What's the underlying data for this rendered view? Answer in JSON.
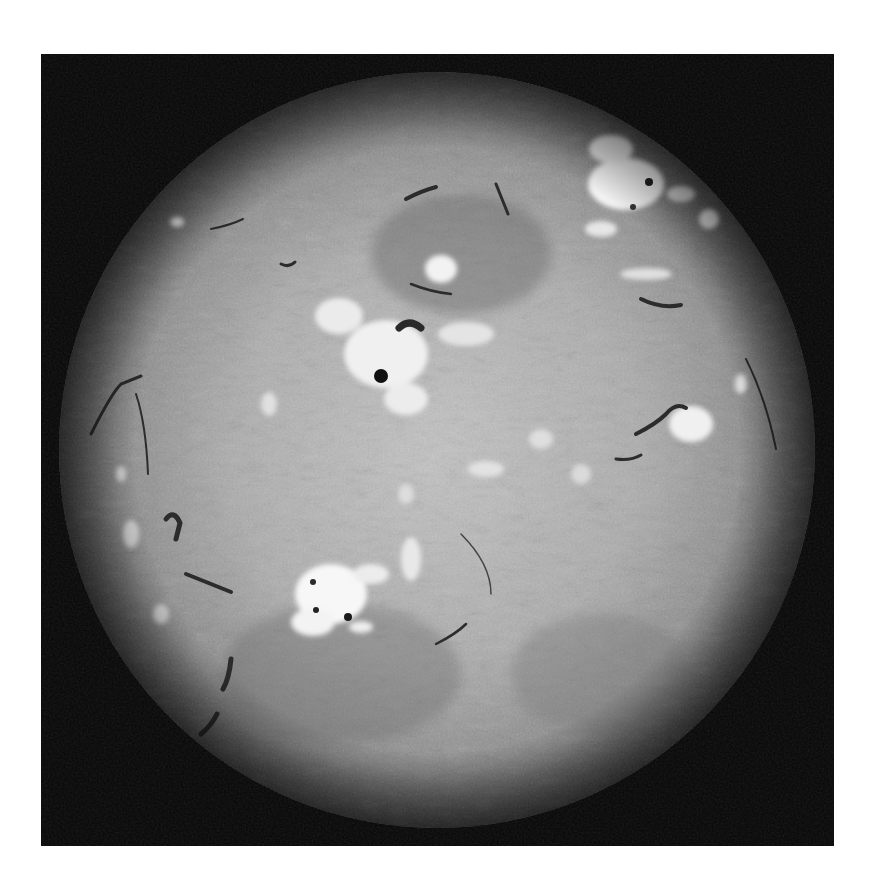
{
  "image": {
    "subject": "Full-disk solar chromosphere (H-alpha style, grayscale)",
    "frame": {
      "x": 41,
      "y": 54,
      "width": 793,
      "height": 792,
      "background": "#060606"
    },
    "page_background": "#ffffff",
    "disk": {
      "cx": 396,
      "cy": 396,
      "r": 378,
      "center_color": "#bdbdbd",
      "limb_color": "#5a5a5a"
    }
  },
  "features": {
    "plage_regions": [
      {
        "name": "ne-active-region",
        "cx": 585,
        "cy": 120,
        "rx": 55,
        "ry": 45
      },
      {
        "name": "central-active-region",
        "cx": 345,
        "cy": 290,
        "rx": 75,
        "ry": 55
      },
      {
        "name": "south-active-region",
        "cx": 290,
        "cy": 530,
        "rx": 60,
        "ry": 45
      },
      {
        "name": "east-limb-plage",
        "cx": 648,
        "cy": 368,
        "rx": 32,
        "ry": 25
      },
      {
        "name": "small-bright-point",
        "cx": 136,
        "cy": 170,
        "rx": 8,
        "ry": 6
      },
      {
        "name": "north-plage",
        "cx": 402,
        "cy": 210,
        "rx": 22,
        "ry": 18
      }
    ],
    "sunspots": [
      {
        "name": "central-spot",
        "cx": 340,
        "cy": 322,
        "r": 7
      },
      {
        "name": "south-spot-1",
        "cx": 307,
        "cy": 563,
        "r": 4
      },
      {
        "name": "south-spot-2",
        "cx": 275,
        "cy": 555,
        "r": 3
      },
      {
        "name": "ne-spot",
        "cx": 608,
        "cy": 128,
        "r": 4
      }
    ],
    "filaments_count": 14
  }
}
